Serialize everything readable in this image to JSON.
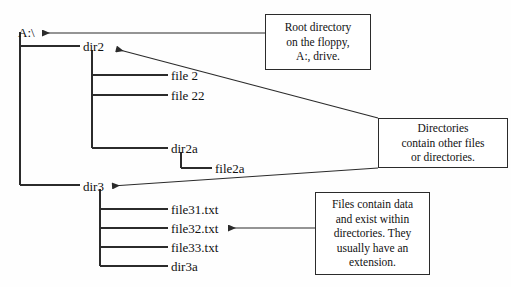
{
  "diagram": {
    "tree": {
      "root": {
        "label": "A:\\",
        "x": 18,
        "y": 26
      },
      "nodes": [
        {
          "id": "dir2",
          "label": "dir2",
          "type": "directory",
          "depth": 1,
          "x": 83,
          "y": 40
        },
        {
          "id": "file2",
          "label": "file 2",
          "type": "file",
          "depth": 2,
          "x": 171,
          "y": 69
        },
        {
          "id": "file22",
          "label": "file 22",
          "type": "file",
          "depth": 2,
          "x": 171,
          "y": 89
        },
        {
          "id": "dir2a",
          "label": "dir2a",
          "type": "directory",
          "depth": 2,
          "x": 171,
          "y": 142
        },
        {
          "id": "file2a",
          "label": "file2a",
          "type": "file",
          "depth": 3,
          "x": 215,
          "y": 162
        },
        {
          "id": "dir3",
          "label": "dir3",
          "type": "directory",
          "depth": 1,
          "x": 83,
          "y": 180
        },
        {
          "id": "file31",
          "label": "file31.txt",
          "type": "file",
          "depth": 2,
          "x": 171,
          "y": 203
        },
        {
          "id": "file32",
          "label": "file32.txt",
          "type": "file",
          "depth": 2,
          "x": 171,
          "y": 222
        },
        {
          "id": "file33",
          "label": "file33.txt",
          "type": "file",
          "depth": 2,
          "x": 171,
          "y": 241
        },
        {
          "id": "dir3a",
          "label": "dir3a",
          "type": "directory",
          "depth": 2,
          "x": 171,
          "y": 260
        }
      ]
    },
    "callouts": [
      {
        "id": "callout-root",
        "lines": [
          "Root directory",
          "on the floppy,",
          "A:, drive."
        ],
        "text": "Root directory on the floppy, A:, drive.",
        "points_to": "A:\\",
        "x": 265,
        "y": 14,
        "w": 106,
        "h": 56
      },
      {
        "id": "callout-directories",
        "lines": [
          "Directories",
          "contain other files",
          "or directories."
        ],
        "text": "Directories contain other files or directories.",
        "points_to": "dir2, dir3",
        "x": 378,
        "y": 118,
        "w": 130,
        "h": 50
      },
      {
        "id": "callout-files",
        "lines": [
          "Files contain data",
          "and exist within",
          "directories. They",
          "usually have an",
          "extension."
        ],
        "text": "Files contain data and exist within directories. They usually have an extension.",
        "points_to": "file32.txt",
        "x": 315,
        "y": 192,
        "w": 115,
        "h": 83
      }
    ],
    "colors": {
      "line": "#2b2b2b",
      "text": "#111111",
      "background": "#fefefe",
      "box_border": "#2b2b2b"
    }
  }
}
